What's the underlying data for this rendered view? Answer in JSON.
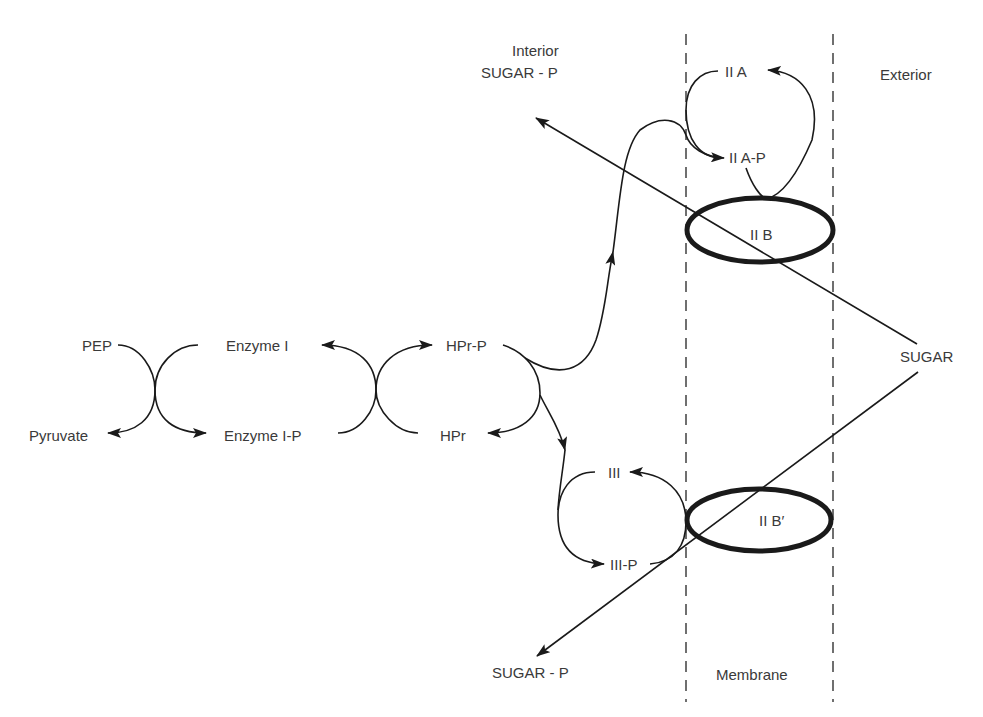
{
  "diagram": {
    "type": "biochemical-pathway",
    "regions": {
      "interior": "Interior",
      "exterior": "Exterior",
      "membrane": "Membrane"
    },
    "nodes": {
      "pep": "PEP",
      "pyruvate": "Pyruvate",
      "enzyme_i": "Enzyme I",
      "enzyme_i_p": "Enzyme I-P",
      "hpr_p": "HPr-P",
      "hpr": "HPr",
      "iia": "II A",
      "iia_p": "II A-P",
      "iib": "II B",
      "iii": "III",
      "iii_p": "III-P",
      "iib_prime": "II B′",
      "sugar": "SUGAR",
      "sugar_p_top": "SUGAR - P",
      "sugar_p_bottom": "SUGAR - P"
    },
    "edges": [
      {
        "from": "PEP",
        "to": "Pyruvate",
        "coupled_with": "Enzyme I -> Enzyme I-P"
      },
      {
        "from": "Enzyme I-P",
        "to": "Enzyme I",
        "coupled_with": "HPr -> HPr-P"
      },
      {
        "from": "HPr-P",
        "to": "HPr",
        "branch": "to II A / III"
      },
      {
        "from": "HPr-P",
        "to": "II A-P",
        "via": "II A"
      },
      {
        "from": "II A-P",
        "to": "II A",
        "via": "II B"
      },
      {
        "from": "HPr-P",
        "to": "III-P",
        "via": "III"
      },
      {
        "from": "III-P",
        "to": "III",
        "via": "II B′"
      },
      {
        "from": "SUGAR",
        "to": "SUGAR - P",
        "via": "II B",
        "side": "interior-top"
      },
      {
        "from": "SUGAR",
        "to": "SUGAR - P",
        "via": "II B′",
        "side": "interior-bottom"
      }
    ]
  }
}
